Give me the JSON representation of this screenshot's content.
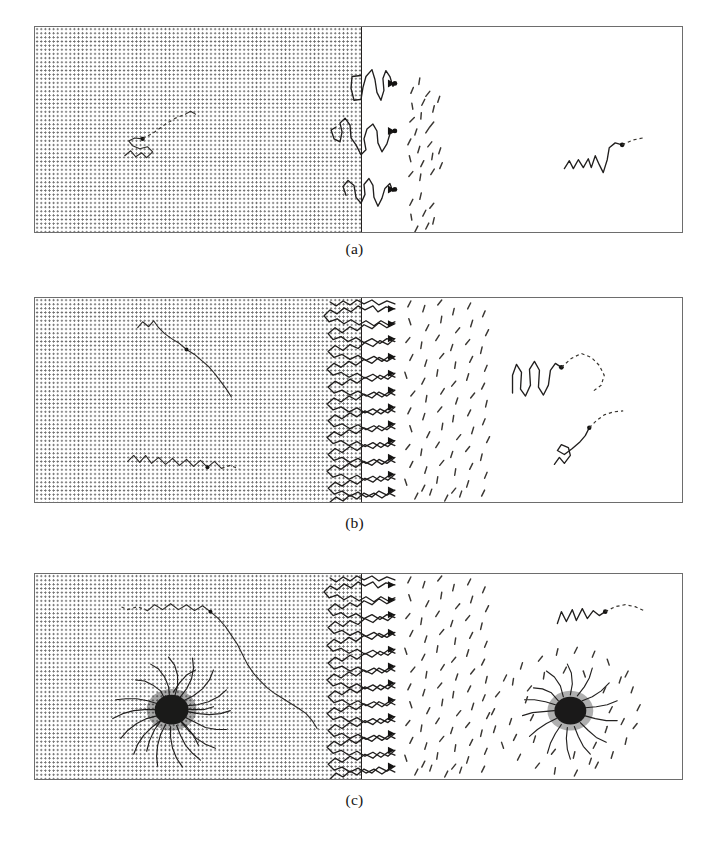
{
  "figure": {
    "type": "scientific-schematic",
    "width": 709,
    "height": 849,
    "background_color": "#ffffff"
  },
  "style": {
    "border_color": "#6d6d6d",
    "interface_color": "#23201e",
    "chain_color": "#211f1e",
    "solvent_color": "#3a3733",
    "dot_color": "#6f6f6f",
    "core_color": "#1b1a19"
  },
  "panels": [
    {
      "id": "a",
      "label": "(a)",
      "regime": "mushroom",
      "grafted_chain_count": 3,
      "free_chain_count_left": 1,
      "free_chain_count_right": 1,
      "micelle_count": 0,
      "solvent_cluster_count": 3,
      "geometry": {
        "x": 34,
        "y": 26,
        "width": 649,
        "height": 207,
        "interface_x_fraction": 0.504
      }
    },
    {
      "id": "b",
      "label": "(b)",
      "regime": "brush",
      "grafted_chain_count": 13,
      "free_chain_count_left": 2,
      "free_chain_count_right": 2,
      "micelle_count": 0,
      "solvent_cluster_count": 1,
      "geometry": {
        "x": 34,
        "y": 297,
        "width": 649,
        "height": 206,
        "interface_x_fraction": 0.504
      }
    },
    {
      "id": "c",
      "label": "(c)",
      "regime": "brush-with-micelles",
      "grafted_chain_count": 13,
      "free_chain_count_left": 1,
      "free_chain_count_right": 1,
      "micelle_count": 2,
      "solvent_cluster_count": 1,
      "geometry": {
        "x": 34,
        "y": 573,
        "width": 649,
        "height": 207,
        "interface_x_fraction": 0.504
      }
    }
  ],
  "labels": {
    "a": "(a)",
    "b": "(b)",
    "c": "(c)"
  }
}
